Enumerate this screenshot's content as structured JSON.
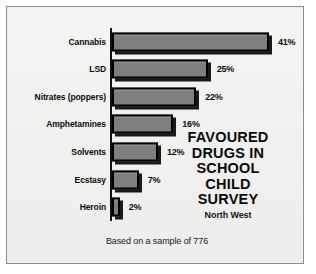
{
  "figure": {
    "background_color": "#f2f2f0",
    "frame_color": "#8d8d8d",
    "bar_fill_color": "#7f7f7f",
    "bar_border_color": "#000000",
    "axis_color": "#111111"
  },
  "title": {
    "lines": [
      "FAVOURED",
      "DRUGS IN",
      "SCHOOL",
      "CHILD",
      "SURVEY"
    ],
    "subtitle": "North West"
  },
  "caption": "Based on a sample of 776",
  "chart_data": {
    "type": "bar",
    "orientation": "horizontal",
    "title": "FAVOURED DRUGS IN SCHOOL CHILD SURVEY",
    "subtitle": "North West",
    "annotations": [
      "Based on a sample of 776"
    ],
    "categories": [
      "Cannabis",
      "LSD",
      "Nitrates (poppers)",
      "Amphetamines",
      "Solvents",
      "Ecstasy",
      "Heroin"
    ],
    "values": [
      41,
      25,
      22,
      16,
      12,
      7,
      2
    ],
    "value_labels": [
      "41%",
      "25%",
      "22%",
      "16%",
      "12%",
      "7%",
      "2%"
    ],
    "xlabel": "",
    "ylabel": "",
    "xlim": [
      0,
      41
    ],
    "grid": false,
    "legend": false,
    "units": "percent"
  }
}
